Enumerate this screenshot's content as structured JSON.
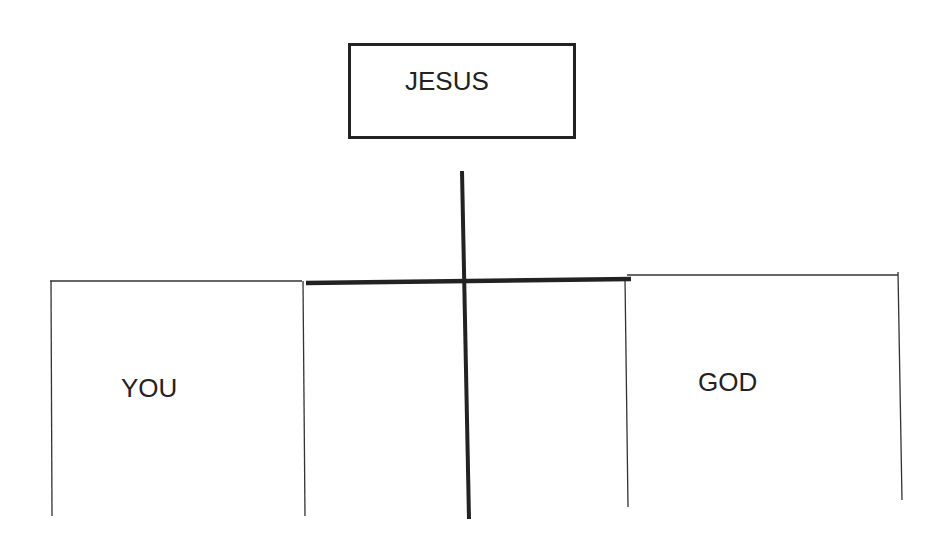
{
  "diagram": {
    "top_box": {
      "label": "JESUS"
    },
    "left_panel": {
      "label": "YOU"
    },
    "right_panel": {
      "label": "GOD"
    },
    "center": {
      "shape": "cross",
      "description": "thick cross bridging the gap between YOU and GOD"
    },
    "colors": {
      "line": "#222222",
      "background": "#ffffff",
      "text": "#222222"
    }
  }
}
